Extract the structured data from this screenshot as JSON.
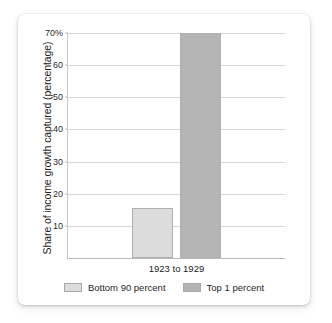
{
  "chart_data": {
    "type": "bar",
    "title": "",
    "subtitle": "",
    "xlabel": "",
    "ylabel": "Share of income growth captured (percentage)",
    "categories": [
      "1923 to 1929"
    ],
    "series": [
      {
        "name": "Bottom 90 percent",
        "values": [
          15.6
        ],
        "color": "#dcdcdc"
      },
      {
        "name": "Top 1 percent",
        "values": [
          70.0
        ],
        "color": "#b4b4b4"
      }
    ],
    "ylim": [
      0,
      70
    ],
    "yticks": [
      70,
      60,
      50,
      40,
      30,
      20,
      10
    ],
    "ytick_labels": [
      "70%",
      "60",
      "50",
      "40",
      "30",
      "20",
      "10"
    ],
    "grid": "horizontal",
    "legend_position": "bottom",
    "bar_border_color": "#b0b0b0",
    "gridline_color": "#d6d6d6",
    "axis_color": "#b9b9b9",
    "background_color": "#ffffff"
  },
  "legend": {
    "items": [
      {
        "label": "Bottom 90 percent",
        "color": "#dcdcdc"
      },
      {
        "label": "Top 1 percent",
        "color": "#b4b4b4"
      }
    ]
  }
}
